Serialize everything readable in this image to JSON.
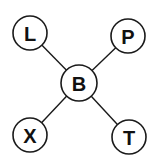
{
  "diagram": {
    "center": "B",
    "nodes": [
      {
        "id": "B",
        "label": "B"
      },
      {
        "id": "L",
        "label": "L"
      },
      {
        "id": "P",
        "label": "P"
      },
      {
        "id": "X",
        "label": "X"
      },
      {
        "id": "T",
        "label": "T"
      }
    ],
    "edges": [
      {
        "from": "B",
        "to": "L"
      },
      {
        "from": "B",
        "to": "P"
      },
      {
        "from": "B",
        "to": "X"
      },
      {
        "from": "B",
        "to": "T"
      }
    ]
  }
}
